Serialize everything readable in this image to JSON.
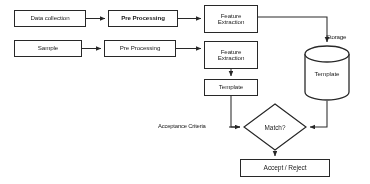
{
  "diagram": {
    "background_color": "#ffffff",
    "stroke_color": "#2b2b2b",
    "text_color": "#1c1c1c",
    "nodes": {
      "data_collection": "Data collection",
      "pre_processing_1": "Pre Processing",
      "feature_extraction_1_line1": "Feature",
      "feature_extraction_1_line2": "Extraction",
      "sample": "Sample",
      "pre_processing_2": "Pre Processing",
      "feature_extraction_2_line1": "Feature",
      "feature_extraction_2_line2": "Extraction",
      "template_box": "Template",
      "storage_cylinder": "Template",
      "decision": "Match?",
      "result": "Accept / Reject"
    },
    "labels": {
      "storage": "Storage",
      "acceptance_criteria": "Acceptance Criteria"
    }
  }
}
